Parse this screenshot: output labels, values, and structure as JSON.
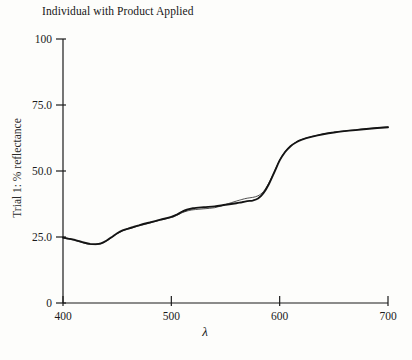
{
  "figure": {
    "title": "Individual with Product Applied",
    "x_axis_label": "λ",
    "y_axis_label": "Trial 1: % reflectance"
  },
  "chart_data": {
    "type": "line",
    "title": "Individual with Product Applied",
    "xlabel": "λ",
    "ylabel": "Trial 1: % reflectance",
    "xlim": [
      400,
      700
    ],
    "ylim": [
      0,
      100
    ],
    "x_tick_values": [
      400,
      500,
      600,
      700
    ],
    "x_tick_labels": [
      "400",
      "500",
      "600",
      "700"
    ],
    "y_tick_values": [
      0,
      25,
      50,
      75,
      100
    ],
    "y_tick_labels": [
      "0",
      "25.0",
      "50.0",
      "75.0",
      "100"
    ],
    "grid": false,
    "legend": "none",
    "axis_color": "#1b1b1b",
    "x": [
      400,
      405,
      410,
      415,
      420,
      425,
      430,
      435,
      440,
      445,
      450,
      455,
      460,
      465,
      470,
      480,
      490,
      500,
      505,
      510,
      515,
      520,
      530,
      540,
      550,
      560,
      565,
      570,
      575,
      580,
      585,
      590,
      595,
      600,
      605,
      610,
      615,
      620,
      630,
      640,
      650,
      660,
      670,
      680,
      690,
      700
    ],
    "series": [
      {
        "name": "reflectance-curve-thick",
        "color": "#141414",
        "width": 1.9,
        "y": [
          24.8,
          24.4,
          24.0,
          23.4,
          22.8,
          22.4,
          22.3,
          22.6,
          23.6,
          25.0,
          26.4,
          27.5,
          28.2,
          28.8,
          29.4,
          30.5,
          31.6,
          32.6,
          33.5,
          34.6,
          35.4,
          35.9,
          36.3,
          36.6,
          37.2,
          37.8,
          38.2,
          38.6,
          38.8,
          39.6,
          41.6,
          45.0,
          49.5,
          54.0,
          57.2,
          59.4,
          60.8,
          61.8,
          63.0,
          63.9,
          64.6,
          65.1,
          65.5,
          65.9,
          66.3,
          66.6
        ]
      },
      {
        "name": "reflectance-curve-thin",
        "color": "#3d3d3d",
        "width": 0.9,
        "y": [
          24.6,
          24.2,
          23.8,
          23.2,
          22.6,
          22.2,
          22.1,
          22.4,
          23.4,
          24.8,
          26.2,
          27.3,
          28.0,
          28.6,
          29.2,
          30.3,
          31.4,
          32.4,
          33.2,
          34.2,
          34.9,
          35.3,
          35.7,
          36.1,
          37.3,
          38.6,
          39.2,
          39.7,
          40.0,
          40.6,
          42.2,
          45.4,
          49.8,
          54.2,
          57.4,
          59.5,
          60.9,
          61.9,
          63.1,
          64.0,
          64.7,
          65.2,
          65.6,
          66.0,
          66.4,
          66.7
        ]
      }
    ]
  }
}
